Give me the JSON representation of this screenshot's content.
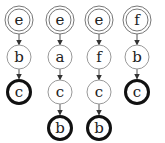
{
  "diagram": {
    "type": "state-chains",
    "colors": {
      "stroke": "#444444",
      "thin": "#888888",
      "bold": "#111111",
      "text": "#222222"
    },
    "chains": [
      {
        "x": 19,
        "nodes": [
          {
            "label": "e",
            "y": 20,
            "style": "double"
          },
          {
            "label": "b",
            "y": 57,
            "style": "normal"
          },
          {
            "label": "c",
            "y": 92,
            "style": "bold"
          }
        ]
      },
      {
        "x": 60,
        "nodes": [
          {
            "label": "e",
            "y": 20,
            "style": "double"
          },
          {
            "label": "a",
            "y": 57,
            "style": "normal"
          },
          {
            "label": "c",
            "y": 92,
            "style": "normal"
          },
          {
            "label": "b",
            "y": 128,
            "style": "bold"
          }
        ]
      },
      {
        "x": 99,
        "nodes": [
          {
            "label": "e",
            "y": 20,
            "style": "double"
          },
          {
            "label": "f",
            "y": 57,
            "style": "normal"
          },
          {
            "label": "c",
            "y": 92,
            "style": "normal"
          },
          {
            "label": "b",
            "y": 128,
            "style": "bold"
          }
        ]
      },
      {
        "x": 137,
        "nodes": [
          {
            "label": "f",
            "y": 20,
            "style": "double"
          },
          {
            "label": "b",
            "y": 57,
            "style": "normal"
          },
          {
            "label": "c",
            "y": 92,
            "style": "bold"
          }
        ]
      }
    ]
  }
}
